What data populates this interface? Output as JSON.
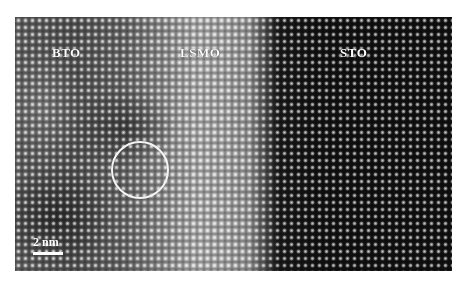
{
  "figure": {
    "type": "HRTEM lattice image",
    "regions": [
      {
        "id": "bto",
        "label": "BTO",
        "x": 52,
        "y": 45
      },
      {
        "id": "lsmo",
        "label": "LSMO",
        "x": 180,
        "y": 45
      },
      {
        "id": "sto",
        "label": "STO",
        "x": 340,
        "y": 45
      }
    ],
    "annotation_circle": {
      "cx": 140,
      "cy": 168,
      "r": 27,
      "color": "#f4f4f4"
    },
    "scale_bar": {
      "label": "2 nm",
      "x": 33,
      "y": 242,
      "length": 30
    },
    "colors": {
      "frame_bg": "#ffffff",
      "sto_region": "#141414",
      "lsmo_region": "#b8b8b8",
      "bto_region": "#6a6a6a"
    }
  }
}
